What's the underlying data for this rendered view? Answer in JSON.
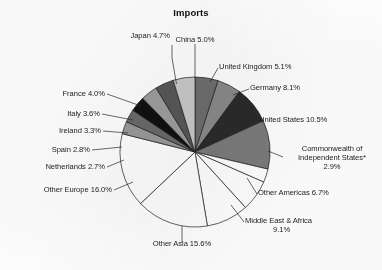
{
  "chart_data": {
    "type": "pie",
    "title": "Imports",
    "xlabel": "",
    "ylabel": "",
    "units": "percent",
    "start_angle_deg": 0,
    "direction": "clockwise",
    "legend": "none",
    "grid": false,
    "footnote_marker": "*",
    "categories": [
      "China",
      "United Kingdom",
      "Germany",
      "United States",
      "Commonwealth of Independent States*",
      "Other Americas",
      "Middle East & Africa",
      "Other Asia",
      "Other Europe",
      "Netherlands",
      "Spain",
      "Ireland",
      "Italy",
      "France",
      "Japan"
    ],
    "values": [
      5.0,
      5.1,
      8.1,
      10.5,
      2.9,
      6.7,
      9.1,
      15.6,
      16.0,
      2.7,
      2.8,
      3.3,
      3.6,
      4.0,
      4.7
    ],
    "slices": [
      {
        "label": "China",
        "value": 5.0,
        "value_text": "5.0%",
        "fill": "#6e6e6e"
      },
      {
        "label": "United Kingdom",
        "value": 5.1,
        "value_text": "5.1%",
        "fill": "#8a8a8a"
      },
      {
        "label": "Germany",
        "value": 8.1,
        "value_text": "8.1%",
        "fill": "#2b2b2b"
      },
      {
        "label": "United States",
        "value": 10.5,
        "value_text": "10.5%",
        "fill": "#7b7b7b"
      },
      {
        "label": "Commonwealth of Independent States*",
        "value": 2.9,
        "value_text": "2.9%",
        "fill": "#ffffff"
      },
      {
        "label": "Other Americas",
        "value": 6.7,
        "value_text": "6.7%",
        "fill": "#ffffff"
      },
      {
        "label": "Middle East & Africa",
        "value": 9.1,
        "value_text": "9.1%",
        "fill": "#ffffff"
      },
      {
        "label": "Other Asia",
        "value": 15.6,
        "value_text": "15.6%",
        "fill": "#ffffff"
      },
      {
        "label": "Other Europe",
        "value": 16.0,
        "value_text": "16.0%",
        "fill": "#ffffff"
      },
      {
        "label": "Netherlands",
        "value": 2.7,
        "value_text": "2.7%",
        "fill": "#9a9a9a"
      },
      {
        "label": "Spain",
        "value": 2.8,
        "value_text": "2.8%",
        "fill": "#6a6a6a"
      },
      {
        "label": "Ireland",
        "value": 3.3,
        "value_text": "3.3%",
        "fill": "#101010"
      },
      {
        "label": "Italy",
        "value": 3.6,
        "value_text": "3.6%",
        "fill": "#9d9d9d"
      },
      {
        "label": "France",
        "value": 4.0,
        "value_text": "4.0%",
        "fill": "#585858"
      },
      {
        "label": "Japan",
        "value": 4.7,
        "value_text": "4.7%",
        "fill": "#c9c9c9"
      }
    ]
  },
  "labels": {
    "china": "China 5.0%",
    "united_kingdom": "United Kingdom 5.1%",
    "germany": "Germany 8.1%",
    "united_states": "United States 10.5%",
    "cis_line1": "Commonwealth of",
    "cis_line2": "Independent States*",
    "cis_line3": "2.9%",
    "other_americas": "Other Americas 6.7%",
    "middle_east_line1": "Middle East & Africa",
    "middle_east_line2": "9.1%",
    "other_asia": "Other Asia 15.6%",
    "other_europe": "Other Europe 16.0%",
    "netherlands": "Netherlands 2.7%",
    "spain": "Spain 2.8%",
    "ireland": "Ireland 3.3%",
    "italy": "Italy 3.6%",
    "france": "France 4.0%",
    "japan": "Japan 4.7%"
  }
}
